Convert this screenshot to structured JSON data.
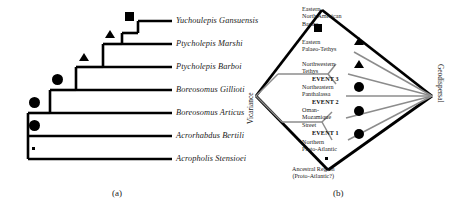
{
  "figure": {
    "panels": [
      {
        "id": "a",
        "caption": "(a)"
      },
      {
        "id": "b",
        "caption": "(b)"
      }
    ]
  },
  "cladogram": {
    "caption": "(a)",
    "taxa": [
      {
        "name": "Yuchoulepis Gansuensis"
      },
      {
        "name": "Ptycholepis Marshi"
      },
      {
        "name": "Ptycholepis Barboi"
      },
      {
        "name": "Boreosomus Gillioti"
      },
      {
        "name": "Boreosomus Articus"
      },
      {
        "name": "Acrorhabdus Bertili"
      },
      {
        "name": "Acropholis Stensioei"
      }
    ],
    "node_markers": [
      {
        "shape": "square",
        "size": "large"
      },
      {
        "shape": "triangle",
        "size": "large"
      },
      {
        "shape": "triangle",
        "size": "large"
      },
      {
        "shape": "circle",
        "size": "large"
      },
      {
        "shape": "circle",
        "size": "large"
      },
      {
        "shape": "circle",
        "size": "large"
      },
      {
        "shape": "square",
        "size": "tiny"
      }
    ],
    "line_color": "#000000"
  },
  "area_diagram": {
    "caption": "(b)",
    "left_axis_label": "Vicariance",
    "right_axis_label": "Geodispersal",
    "areas": [
      {
        "lines": [
          "Eastern",
          "North American",
          "Basins"
        ],
        "marker": "square"
      },
      {
        "lines": [
          "Eastern",
          "Palaeo-Tethys"
        ],
        "marker": "triangle"
      },
      {
        "lines": [
          "Northwestern",
          "Tethys"
        ],
        "marker": "triangle"
      },
      {
        "lines": [
          "Northeastern",
          "Panthalassa"
        ],
        "marker": "circle"
      },
      {
        "lines": [
          "Oman-",
          "Mozamique",
          "Street"
        ],
        "marker": "circle"
      },
      {
        "lines": [
          "Northern",
          "Proto-Atlantic"
        ],
        "marker": "none"
      },
      {
        "lines": [
          "Ancestral Region",
          "(Proto-Atlantic?)"
        ],
        "marker": "tiny-square"
      }
    ],
    "events": [
      {
        "label": "EVENT 3"
      },
      {
        "label": "EVENT 2"
      },
      {
        "label": "EVENT 1"
      }
    ],
    "colors": {
      "outline": "#000000",
      "inner_tree": "#8c8c8c"
    }
  }
}
